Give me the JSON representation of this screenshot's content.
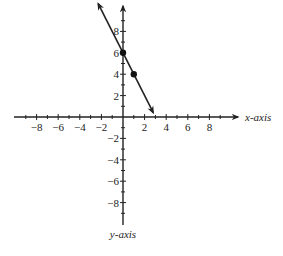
{
  "chart_data": {
    "type": "line",
    "title": "",
    "xlabel": "x-axis",
    "ylabel": "y-axis",
    "xlim": [
      -10,
      10
    ],
    "ylim": [
      -10,
      10
    ],
    "grid": false,
    "x_ticks": [
      -8,
      -6,
      -4,
      -2,
      2,
      4,
      6,
      8
    ],
    "y_ticks": [
      8,
      6,
      4,
      2,
      -2,
      -4,
      -6,
      -8
    ],
    "x_tick_labels": [
      "−8",
      "−6",
      "−4",
      "−2",
      "2",
      "4",
      "6",
      "8"
    ],
    "y_tick_labels": [
      "8",
      "6",
      "4",
      "2",
      "−2",
      "−4",
      "−6",
      "−8"
    ],
    "series": [
      {
        "name": "line",
        "equation": "y = -2x + 6",
        "x": [
          -2.3,
          2.8
        ],
        "y": [
          10.6,
          0.4
        ],
        "arrows_both_ends": true
      }
    ],
    "points": [
      {
        "x": 0,
        "y": 6
      },
      {
        "x": 1,
        "y": 4
      }
    ],
    "colors": {
      "axis": "#222222",
      "line": "#222222",
      "point": "#111111"
    }
  }
}
